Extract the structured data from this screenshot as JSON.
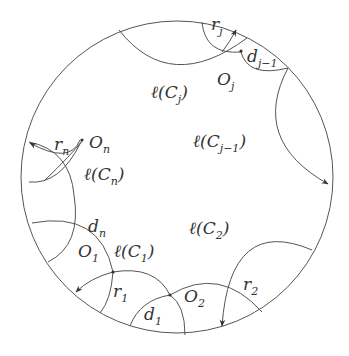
{
  "diagram": {
    "title": "",
    "colors": {
      "stroke": "#555555",
      "text": "#333333",
      "background": "#ffffff"
    },
    "outer_circle": {
      "cx": 177,
      "cy": 177,
      "r": 156
    },
    "labels": {
      "r_j": {
        "main": "r",
        "sub": "j"
      },
      "d_j_minus_1": {
        "main": "d",
        "sub": "j−1"
      },
      "O_j": {
        "main": "O",
        "sub": "j"
      },
      "l_C_j": {
        "main": "ℓ(C",
        "sub": "j",
        "close": ")"
      },
      "l_C_j_minus_1": {
        "main": "ℓ(C",
        "sub": "j−1",
        "close": ")"
      },
      "r_n": {
        "main": "r",
        "sub": "n"
      },
      "O_n": {
        "main": "O",
        "sub": "n"
      },
      "l_C_n": {
        "main": "ℓ(C",
        "sub": "n",
        "close": ")"
      },
      "d_n": {
        "main": "d",
        "sub": "n"
      },
      "O_1": {
        "main": "O",
        "sub": "1"
      },
      "l_C_1": {
        "main": "ℓ(C",
        "sub": "1",
        "close": ")"
      },
      "l_C_2": {
        "main": "ℓ(C",
        "sub": "2",
        "close": ")"
      },
      "r_1": {
        "main": "r",
        "sub": "1"
      },
      "O_2": {
        "main": "O",
        "sub": "2"
      },
      "r_2": {
        "main": "r",
        "sub": "2"
      },
      "d_1": {
        "main": "d",
        "sub": "1"
      }
    }
  }
}
